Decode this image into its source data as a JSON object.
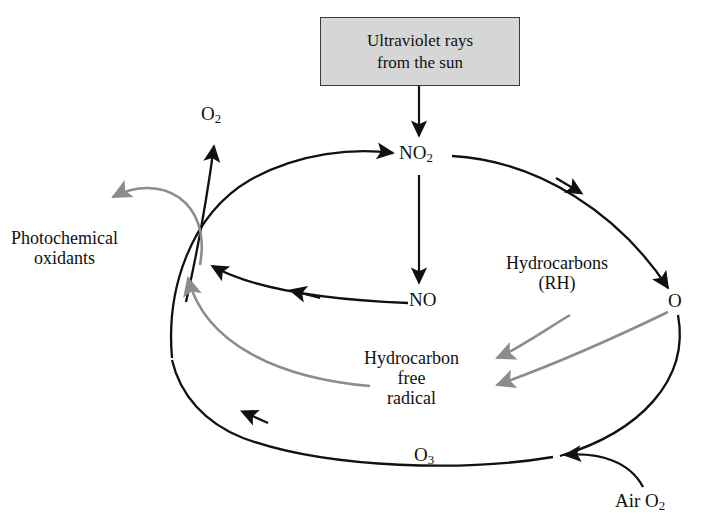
{
  "diagram": {
    "background_color": "#ffffff",
    "stroke_black": "#111111",
    "stroke_gray": "#8c8c8c",
    "box_fill": "#d6d6d6",
    "box_border": "#3a3a3a"
  },
  "source_box": {
    "line1": "Ultraviolet rays",
    "line2": "from the sun"
  },
  "nodes": {
    "no2": {
      "text": "NO",
      "sub": "2"
    },
    "no": {
      "text": "NO",
      "sub": ""
    },
    "o": {
      "text": "O",
      "sub": ""
    },
    "o3": {
      "text": "O",
      "sub": "3"
    },
    "o2_released": {
      "text": "O",
      "sub": "2"
    },
    "air_o2": {
      "text": "Air O",
      "sub": "2"
    },
    "hydrocarbons_line1": "Hydrocarbons",
    "hydrocarbons_line2": "(RH)",
    "radical_line1": "Hydrocarbon",
    "radical_line2": "free",
    "radical_line3": "radical",
    "oxidants_line1": "Photochemical",
    "oxidants_line2": "oxidants"
  },
  "edges": [
    {
      "id": "uv-to-no2",
      "from": "Ultraviolet rays from the sun",
      "to": "NO2",
      "color": "#111111",
      "style": "straight-down"
    },
    {
      "id": "no2-to-o",
      "from": "NO2",
      "to": "O",
      "color": "#111111",
      "style": "curve-right-down"
    },
    {
      "id": "no2-to-no",
      "from": "NO2",
      "to": "NO",
      "color": "#111111",
      "style": "straight-down"
    },
    {
      "id": "no-to-junction",
      "from": "NO",
      "to": "junction",
      "color": "#111111",
      "style": "curve-left"
    },
    {
      "id": "o-to-o3",
      "from": "O",
      "to": "O3",
      "color": "#111111",
      "style": "curve-down-left"
    },
    {
      "id": "o3-to-junction",
      "from": "O3",
      "to": "junction",
      "color": "#111111",
      "style": "curve-up-left"
    },
    {
      "id": "junction-to-no2",
      "from": "junction",
      "to": "NO2",
      "color": "#111111",
      "style": "curve-up-right"
    },
    {
      "id": "junction-to-o2",
      "from": "junction",
      "to": "O2",
      "color": "#111111",
      "style": "curve-up"
    },
    {
      "id": "air-o2-to-o3",
      "from": "Air O2",
      "to": "O3",
      "color": "#111111",
      "style": "curve-up-left"
    },
    {
      "id": "junction-to-oxidants",
      "from": "junction",
      "to": "Photochemical oxidants",
      "color": "#8c8c8c",
      "style": "curve-up-left"
    },
    {
      "id": "radical-to-junction",
      "from": "Hydrocarbon free radical",
      "to": "junction",
      "color": "#8c8c8c",
      "style": "curve-left-up"
    },
    {
      "id": "hydrocarbons-to-radical",
      "from": "Hydrocarbons (RH)",
      "to": "Hydrocarbon free radical",
      "color": "#8c8c8c",
      "style": "curve-left"
    },
    {
      "id": "o-to-radical",
      "from": "O",
      "to": "Hydrocarbon free radical",
      "color": "#8c8c8c",
      "style": "curve-left"
    }
  ]
}
